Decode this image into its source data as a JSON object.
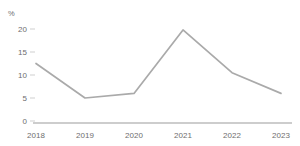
{
  "chart_data": {
    "type": "line",
    "title": "",
    "subtitle": "",
    "xlabel": "",
    "ylabel": "%",
    "unit_label": "%",
    "categories": [
      "2018",
      "2019",
      "2020",
      "2021",
      "2022",
      "2023"
    ],
    "x": [
      "2018",
      "2019",
      "2020",
      "2021",
      "2022",
      "2023"
    ],
    "values": [
      12.5,
      5.0,
      6.0,
      19.8,
      10.5,
      6.0
    ],
    "series": [
      {
        "name": "",
        "values": [
          12.5,
          5.0,
          6.0,
          19.8,
          10.5,
          6.0
        ],
        "color": "#aaaaaa"
      }
    ],
    "ylim": [
      0,
      20
    ],
    "y_ticks": [
      0,
      5,
      10,
      15,
      20
    ],
    "y_tick_labels": [
      "0",
      "5",
      "10",
      "15",
      "20"
    ],
    "x_tick_labels": [
      "2018",
      "2019",
      "2020",
      "2021",
      "2022",
      "2023"
    ],
    "grid": false,
    "legend": false,
    "legend_position": "none",
    "markers": false,
    "axis_color": "#bdbdbd",
    "tick_color": "#c9c9c9",
    "text_color": "#6e6e6e",
    "line_color": "#aaaaaa",
    "background": "#ffffff"
  }
}
